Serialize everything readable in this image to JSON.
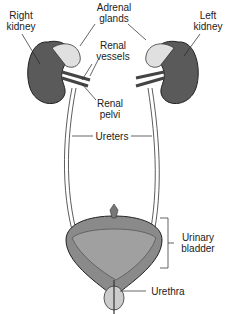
{
  "diagram": {
    "labels": {
      "right_kidney": [
        "Right",
        "kidney"
      ],
      "left_kidney": [
        "Left",
        "kidney"
      ],
      "adrenal_glands": [
        "Adrenal",
        "glands"
      ],
      "renal_vessels": [
        "Renal",
        "vessels"
      ],
      "renal_pelvi": [
        "Renal",
        "pelvi"
      ],
      "ureters": "Ureters",
      "urinary_bladder": [
        "Urinary",
        "bladder"
      ],
      "urethra": "Urethra"
    },
    "colors": {
      "kidney": "#5a5a5a",
      "adrenal": "#d9d9d9",
      "bladder": "#8a8a8a",
      "outline": "#222222",
      "background": "#ffffff"
    }
  }
}
